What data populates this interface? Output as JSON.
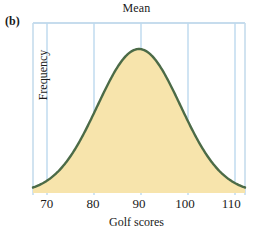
{
  "figure": {
    "panel_label": "(b)",
    "title": "Mean",
    "x_axis_title": "Golf scores",
    "y_axis_title": "Frequency"
  },
  "colors": {
    "curve_stroke": "#4c6b47",
    "curve_fill": "#f7e4ac",
    "gridline": "#bcd9ee",
    "border": "#c6dced",
    "text": "#1a1a1a",
    "background": "#ffffff"
  },
  "chart_data": {
    "type": "area",
    "title": "Mean",
    "xlabel": "Golf scores",
    "ylabel": "Frequency",
    "xlim": [
      67,
      113
    ],
    "ylim": [
      0,
      1
    ],
    "grid": true,
    "legend": null,
    "distribution": "normal",
    "mean": 90,
    "std_dev": 9,
    "tick_labels": [
      "70",
      "80",
      "90",
      "100",
      "110"
    ],
    "tick_values": [
      70,
      80,
      90,
      100,
      110
    ],
    "y_tick_labels": [],
    "annotations": [
      {
        "text": "Mean",
        "x": 90,
        "position": "top"
      }
    ],
    "x": [
      67,
      69,
      71,
      73,
      75,
      77,
      79,
      81,
      83,
      85,
      87,
      89,
      90,
      91,
      93,
      95,
      97,
      99,
      101,
      103,
      105,
      107,
      109,
      111,
      113
    ],
    "y": [
      0.007,
      0.018,
      0.04,
      0.082,
      0.152,
      0.252,
      0.375,
      0.513,
      0.646,
      0.789,
      0.905,
      0.994,
      1.0,
      0.994,
      0.905,
      0.789,
      0.646,
      0.513,
      0.375,
      0.252,
      0.152,
      0.082,
      0.04,
      0.018,
      0.007
    ]
  }
}
